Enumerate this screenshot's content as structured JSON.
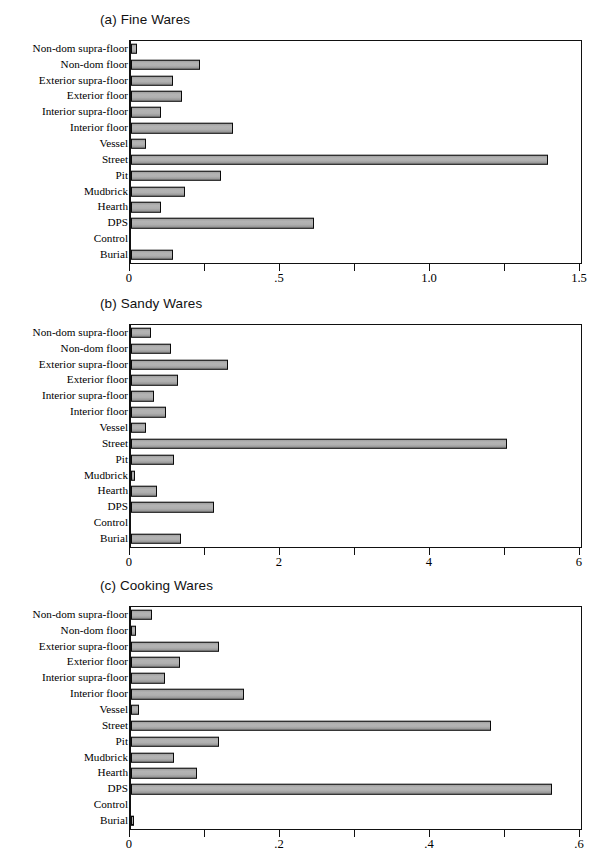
{
  "figure": {
    "background": "#ffffff",
    "bar_fill": "#aaaaaa",
    "bar_edge": "#0a0a0a"
  },
  "categories": [
    "Non-dom supra-floor",
    "Non-dom floor",
    "Exterior supra-floor",
    "Exterior floor",
    "Interior supra-floor",
    "Interior floor",
    "Vessel",
    "Street",
    "Pit",
    "Mudbrick",
    "Hearth",
    "DPS",
    "Control",
    "Burial"
  ],
  "chart_data": [
    {
      "type": "bar",
      "orientation": "horizontal",
      "title": "(a) Fine Wares",
      "xlabel": "",
      "ylabel": "",
      "xlim": [
        0,
        1.5
      ],
      "xticks": [
        0,
        0.25,
        0.5,
        0.75,
        1.0,
        1.25,
        1.5
      ],
      "xticklabels": [
        "0",
        "",
        ".5",
        "",
        "1.0",
        "",
        "1.5"
      ],
      "grid": false,
      "legend": false,
      "categories": [
        "Non-dom supra-floor",
        "Non-dom floor",
        "Exterior supra-floor",
        "Exterior floor",
        "Interior supra-floor",
        "Interior floor",
        "Vessel",
        "Street",
        "Pit",
        "Mudbrick",
        "Hearth",
        "DPS",
        "Control",
        "Burial"
      ],
      "values": [
        0.02,
        0.23,
        0.14,
        0.17,
        0.1,
        0.34,
        0.05,
        1.39,
        0.3,
        0.18,
        0.1,
        0.61,
        0.0,
        0.14
      ]
    },
    {
      "type": "bar",
      "orientation": "horizontal",
      "title": "(b) Sandy Wares",
      "xlabel": "",
      "ylabel": "",
      "xlim": [
        0,
        6
      ],
      "xticks": [
        0,
        1,
        2,
        3,
        4,
        5,
        6
      ],
      "xticklabels": [
        "0",
        "",
        "2",
        "",
        "4",
        "",
        "6"
      ],
      "grid": false,
      "legend": false,
      "categories": [
        "Non-dom supra-floor",
        "Non-dom floor",
        "Exterior supra-floor",
        "Exterior floor",
        "Interior supra-floor",
        "Interior floor",
        "Vessel",
        "Street",
        "Pit",
        "Mudbrick",
        "Hearth",
        "DPS",
        "Control",
        "Burial"
      ],
      "values": [
        0.27,
        0.53,
        1.29,
        0.63,
        0.3,
        0.47,
        0.2,
        5.01,
        0.57,
        0.05,
        0.34,
        1.1,
        0.0,
        0.67
      ]
    },
    {
      "type": "bar",
      "orientation": "horizontal",
      "title": "(c) Cooking Wares",
      "xlabel": "",
      "ylabel": "",
      "xlim": [
        0,
        0.6
      ],
      "xticks": [
        0,
        0.1,
        0.2,
        0.3,
        0.4,
        0.5,
        0.6
      ],
      "xticklabels": [
        "0",
        "",
        ".2",
        "",
        ".4",
        "",
        ".6"
      ],
      "grid": false,
      "legend": false,
      "categories": [
        "Non-dom supra-floor",
        "Non-dom floor",
        "Exterior supra-floor",
        "Exterior floor",
        "Interior supra-floor",
        "Interior floor",
        "Vessel",
        "Street",
        "Pit",
        "Mudbrick",
        "Hearth",
        "DPS",
        "Control",
        "Burial"
      ],
      "values": [
        0.028,
        0.006,
        0.117,
        0.065,
        0.045,
        0.15,
        0.01,
        0.48,
        0.117,
        0.057,
        0.088,
        0.561,
        0.0,
        0.004
      ]
    }
  ]
}
